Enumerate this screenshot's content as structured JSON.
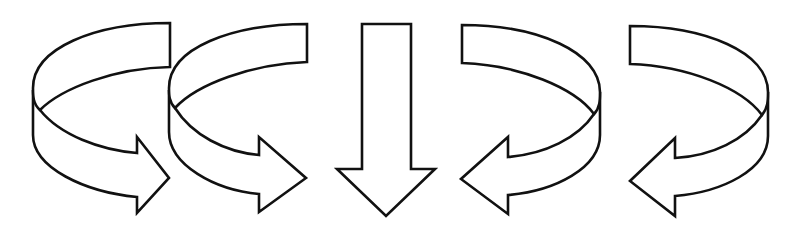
{
  "diagram": {
    "title": "",
    "background": "#ffffff",
    "stroke_color": "#111111",
    "arrows": [
      {
        "id": "arrow-1",
        "type": "curved-3d-arrow",
        "direction": "counterclockwise-right",
        "label": ""
      },
      {
        "id": "arrow-2",
        "type": "curved-3d-arrow",
        "direction": "counterclockwise-right",
        "label": ""
      },
      {
        "id": "arrow-3",
        "type": "straight-arrow",
        "direction": "down",
        "label": ""
      },
      {
        "id": "arrow-4",
        "type": "curved-3d-arrow",
        "direction": "clockwise-left",
        "label": ""
      },
      {
        "id": "arrow-5",
        "type": "curved-3d-arrow",
        "direction": "clockwise-left",
        "label": ""
      }
    ]
  }
}
